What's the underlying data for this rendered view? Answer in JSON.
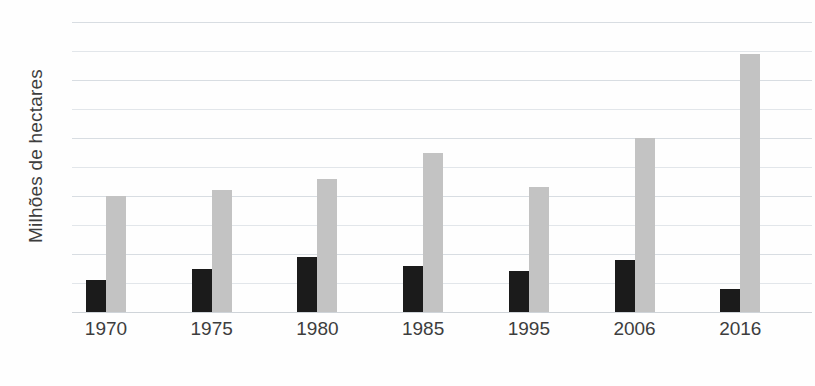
{
  "chart_data": {
    "type": "bar",
    "title": "",
    "subtitle": "",
    "xlabel": "",
    "ylabel": "Milhões de hectares",
    "categories": [
      "1970",
      "1975",
      "1980",
      "1985",
      "1995",
      "2006",
      "2016"
    ],
    "series": [
      {
        "name": "serie-escura",
        "color": "#1b1b1b",
        "values": [
          11,
          15,
          19,
          16,
          14,
          18,
          8
        ]
      },
      {
        "name": "serie-clara",
        "color": "#c3c3c3",
        "values": [
          40,
          42,
          46,
          55,
          43,
          60,
          89
        ]
      }
    ],
    "ylim": [
      0,
      100
    ],
    "yticks": [
      0,
      10,
      20,
      30,
      40,
      50,
      60,
      70,
      80,
      90,
      100
    ],
    "ytick_labels": [
      "",
      "",
      "",
      "",
      "",
      "",
      "",
      "",
      "",
      "",
      ""
    ],
    "grid": true,
    "grid_color": "#d8dde2",
    "legend": false,
    "legend_position": "none",
    "annotations": []
  },
  "axis": {
    "y_title": "Milhões de hectares",
    "x_ticks": [
      "1970",
      "1975",
      "1980",
      "1985",
      "1995",
      "2006",
      "2016"
    ]
  },
  "colors": {
    "dark_series": "#1b1b1b",
    "light_series": "#c3c3c3",
    "gridline": "#d8dde2",
    "background": "#fefefe",
    "text": "#3d3d3d"
  }
}
